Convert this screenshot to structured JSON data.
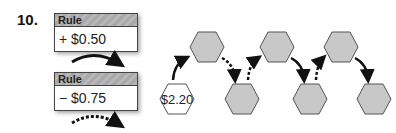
{
  "problem_number": "10.",
  "rules": [
    {
      "header": "Rule",
      "value": "+ $0.50"
    },
    {
      "header": "Rule",
      "value": "− $0.75"
    }
  ],
  "legend_arrows": [
    {
      "rule_index": 0,
      "style": "solid"
    },
    {
      "rule_index": 1,
      "style": "dashed"
    }
  ],
  "start_value": "$2.20",
  "colors": {
    "hex_fill": "#c8c8c8",
    "hex_stroke": "#555555",
    "start_fill": "#ffffff"
  }
}
